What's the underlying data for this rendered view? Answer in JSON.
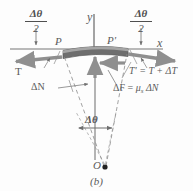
{
  "figure": {
    "caption": "(b)",
    "axes": {
      "x_label": "x",
      "y_label": "y"
    },
    "points": {
      "left_contact": "P",
      "right_contact": "P'",
      "center": "O"
    },
    "angles": {
      "half_angle_numerator": "Δθ",
      "half_angle_denominator": "2",
      "full_angle": "Δθ"
    },
    "forces": {
      "tension_left": "T",
      "tension_right": "T' = T + ΔT",
      "normal": "ΔN",
      "friction_symbol": "ΔF",
      "friction_equals": "=",
      "friction_mu": "μ",
      "friction_mu_sub": "s",
      "friction_dn": "ΔN"
    },
    "colors": {
      "line": "#6f6f6f",
      "band_fill": "#6b6b6b",
      "band_top": "#a8a8a8",
      "arrow": "#8a8a8a",
      "text": "#5b5b5b",
      "background": "#fdfdfd"
    }
  }
}
